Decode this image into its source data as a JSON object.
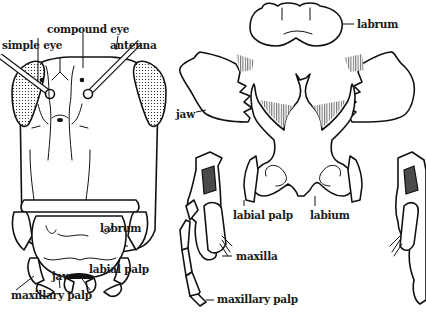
{
  "diagram": {
    "colors": {
      "ink": "#111111",
      "background": "#ffffff"
    },
    "head_view": {
      "labels": {
        "compound_eye": "compound eye",
        "simple_eye": "simple eye",
        "antenna": "antenna",
        "labrum": "labrum",
        "jaw": "jaw",
        "labial_palp": "labial palp",
        "maxillary_palp": "maxillary palp"
      }
    },
    "exploded_view": {
      "labels": {
        "labrum": "labrum",
        "jaw": "jaw",
        "labial_palp": "labial palp",
        "labium": "labium",
        "maxilla": "maxilla",
        "maxillary_palp": "maxillary palp"
      }
    }
  }
}
